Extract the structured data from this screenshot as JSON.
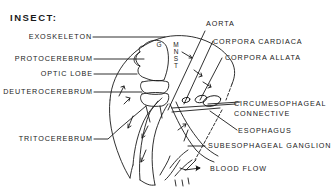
{
  "title": "INSECT:",
  "labels": {
    "exoskeleton": "EXOSKELETON",
    "protocerebrum": "PROTOCEREBRUM",
    "optic_lobe": "OPTIC LOBE",
    "deuterocerebrum": "DEUTEROCEREBRUM",
    "tritocerebrum": "TRITOCEREBRUM",
    "aorta": "AORTA",
    "corpora_cardiaca": "CORPORA CARDIACA",
    "corpora_allata": "CORPORA ALLATA",
    "circumesophageal_line1": "CIRCUMESOPHAGEAL",
    "circumesophageal_line2": "CONNECTIVE",
    "esophagus": "ESOPHAGUS",
    "subesophageal_ganglion": "SUBESOPHAGEAL GANGLION",
    "blood_flow": "BLOOD FLOW"
  },
  "region_markers": {
    "g": "G",
    "m": "M",
    "n": "N",
    "s": "S",
    "t": "T"
  },
  "colors": {
    "ink": "#1a1a1a",
    "background": "#ffffff"
  }
}
